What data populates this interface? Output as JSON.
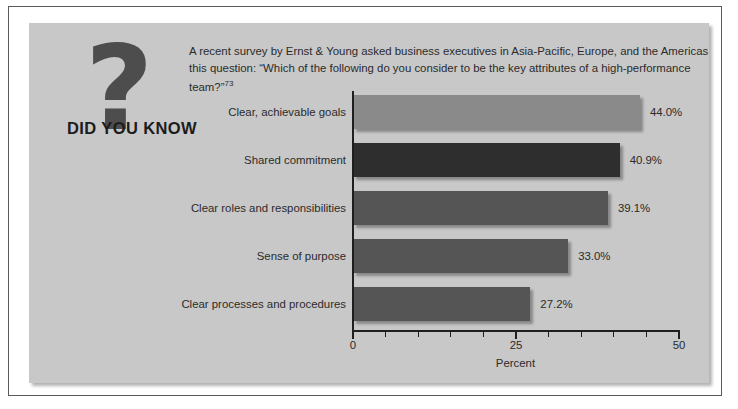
{
  "badge": {
    "question_mark": "?",
    "title": "DID YOU KNOW"
  },
  "blurb": {
    "text": "A recent survey by Ernst & Young asked business executives in Asia-Pacific, Europe, and the Americas this question: “Which of the following do you consider to be the key attributes of a high-performance team?”",
    "footnote": "73"
  },
  "colors": {
    "panel_background": "#c8c8c8",
    "page_background": "#ffffff",
    "frame_border": "#5a5a5a",
    "text": "#2b2b2b",
    "axis": "#1f1f1f",
    "bar_light": "#8a8a8a",
    "bar_dark": "#2e2e2e",
    "bar_medium": "#555555",
    "badge_mark": "#4d4d4d",
    "badge_title": "#1c1c1c"
  },
  "chart_data": {
    "type": "bar",
    "orientation": "horizontal",
    "title": "",
    "xlabel": "Percent",
    "ylabel": "",
    "xlim": [
      0,
      50
    ],
    "grid": false,
    "legend": null,
    "xticks_major": [
      0,
      25,
      50
    ],
    "xticks_major_labels": [
      "0",
      "25",
      "50"
    ],
    "xticks_minor": [
      5,
      10,
      15,
      20,
      30,
      35,
      40,
      45
    ],
    "categories": [
      "Clear, achievable goals",
      "Shared commitment",
      "Clear roles and responsibilities",
      "Sense of purpose",
      "Clear processes and procedures"
    ],
    "values": [
      44.0,
      40.9,
      39.1,
      33.0,
      27.2
    ],
    "data_labels": [
      "44.0%",
      "40.9%",
      "39.1%",
      "33.0%",
      "27.2%"
    ],
    "bar_colors": [
      "#8a8a8a",
      "#2e2e2e",
      "#555555",
      "#555555",
      "#555555"
    ]
  }
}
